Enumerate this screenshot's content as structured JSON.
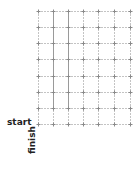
{
  "labels": {
    "start": "start",
    "finish": "finish"
  },
  "grid": {
    "columns": 6,
    "rows": 7,
    "x_lines": [
      38,
      53,
      68,
      83,
      98,
      114,
      130
    ],
    "y_lines": [
      11,
      27,
      43,
      59,
      76,
      92,
      108,
      124
    ],
    "dark_vertical_segments": [
      {
        "x": 53,
        "y1": 11,
        "y2": 108
      },
      {
        "x": 68,
        "y1": 11,
        "y2": 108
      }
    ]
  },
  "colors": {
    "line": "#c4c4c4",
    "wall": "#9a9a9a",
    "node": "#8a8a8a",
    "text": "#222222"
  }
}
